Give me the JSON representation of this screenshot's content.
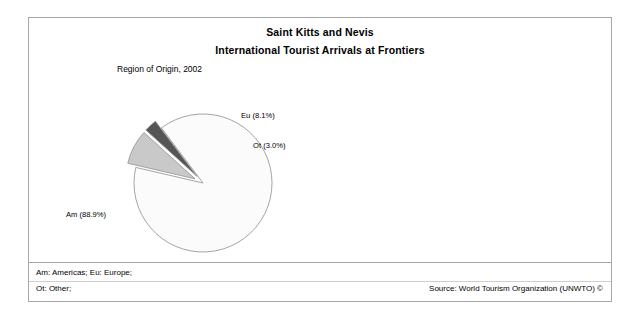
{
  "chart_data": {
    "type": "pie",
    "title": "Saint Kitts and Nevis",
    "subtitle": "International Tourist Arrivals at Frontiers",
    "plot_caption": "Region of Origin, 2002",
    "categories": [
      "Am",
      "Eu",
      "Ot"
    ],
    "values": [
      88.9,
      8.1,
      3.0
    ],
    "labels": [
      "Am (88.9%)",
      "Eu (8.1%)",
      "Ot (3.0%)"
    ],
    "slices": [
      {
        "code": "Am",
        "name": "Americas",
        "value": 88.9,
        "label": "Am (88.9%)",
        "color": "#fbfbfb",
        "exploded": false
      },
      {
        "code": "Eu",
        "name": "Europe",
        "value": 8.1,
        "label": "Eu (8.1%)",
        "color": "#c9c9c9",
        "exploded": true
      },
      {
        "code": "Ot",
        "name": "Other",
        "value": 3.0,
        "label": "Ot (3.0%)",
        "color": "#555555",
        "exploded": true
      }
    ],
    "units": "percent",
    "legend_position": "labels-outside",
    "grid": false,
    "xlabel": "",
    "ylabel": ""
  },
  "header": {
    "title": "Saint Kitts and Nevis",
    "subtitle": "International Tourist Arrivals at Frontiers"
  },
  "plot": {
    "caption": "Region of Origin, 2002",
    "label_am": "Am (88.9%)",
    "label_eu": "Eu (8.1%)",
    "label_ot": "Ot (3.0%)"
  },
  "footer": {
    "legend_line_1": "Am: Americas; Eu: Europe;",
    "legend_line_2": "Ot: Other;",
    "source": "Source: World Tourism Organization (UNWTO) ©"
  },
  "style": {
    "frame_color": "#a8a8a8",
    "outline_color": "#9a9a9a",
    "background": "#ffffff"
  }
}
